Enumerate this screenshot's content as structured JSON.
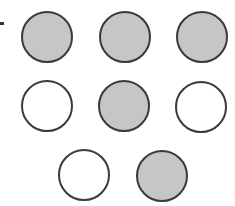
{
  "diagram": {
    "fill_color": "#c6c6c6",
    "stroke_color": "#3a3a3a",
    "rows": [
      {
        "circles": [
          {
            "state": "filled"
          },
          {
            "state": "filled"
          },
          {
            "state": "filled"
          }
        ]
      },
      {
        "circles": [
          {
            "state": "open"
          },
          {
            "state": "filled"
          },
          {
            "state": "open"
          }
        ]
      },
      {
        "circles": [
          {
            "state": "open"
          },
          {
            "state": "filled"
          }
        ]
      }
    ],
    "counts": {
      "filled": 5,
      "open": 3,
      "total": 8
    }
  }
}
